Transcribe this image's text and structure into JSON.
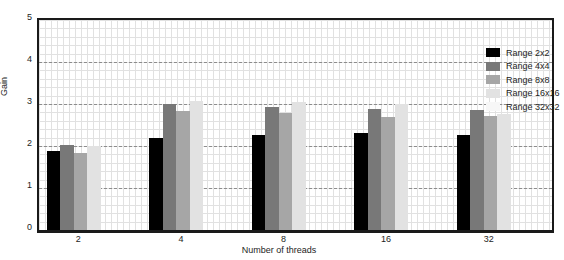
{
  "chart_data": {
    "type": "bar",
    "title": "",
    "xlabel": "Number of threads",
    "ylabel": "Gain",
    "categories": [
      "2",
      "4",
      "8",
      "16",
      "32"
    ],
    "ylim": [
      0,
      5
    ],
    "yticks": [
      "0",
      "1",
      "2",
      "3",
      "4",
      "5"
    ],
    "grid": true,
    "grid_style": "dashed major, dotted minor",
    "legend_position": "upper right",
    "series": [
      {
        "name": "Range 2x2",
        "color": "#000000",
        "values": [
          1.88,
          2.2,
          2.27,
          2.3,
          2.26
        ]
      },
      {
        "name": "Range 4x4",
        "color": "#787878",
        "values": [
          2.02,
          3.0,
          2.94,
          2.89,
          2.85
        ]
      },
      {
        "name": "Range 8x8",
        "color": "#a6a6a6",
        "values": [
          1.84,
          2.84,
          2.78,
          2.68,
          2.72
        ]
      },
      {
        "name": "Range 16x16",
        "color": "#e2e2e2",
        "values": [
          1.99,
          3.08,
          3.05,
          2.99,
          2.77
        ]
      },
      {
        "name": "Range 32x32",
        "color": "#f7f7f7",
        "values": [
          0.0,
          0.0,
          0.0,
          0.0,
          0.0
        ]
      }
    ]
  },
  "axes": {
    "y_label": "Gain",
    "x_label": "Number of threads"
  }
}
